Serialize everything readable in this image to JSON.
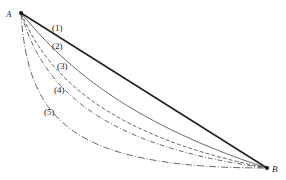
{
  "diagram": {
    "points": {
      "A": {
        "label": "A",
        "x": 21,
        "y": 13
      },
      "B": {
        "label": "B",
        "x": 267,
        "y": 168
      }
    },
    "curves": [
      {
        "id": "1",
        "label": "(1)",
        "style": "solid-thick",
        "description": "straight line"
      },
      {
        "id": "2",
        "label": "(2)",
        "style": "solid-thin"
      },
      {
        "id": "3",
        "label": "(3)",
        "style": "dashed"
      },
      {
        "id": "4",
        "label": "(4)",
        "style": "dash-dot"
      },
      {
        "id": "5",
        "label": "(5)",
        "style": "dash-dot-long"
      }
    ],
    "colors": {
      "ink": "#222222",
      "background": "#ffffff"
    }
  }
}
